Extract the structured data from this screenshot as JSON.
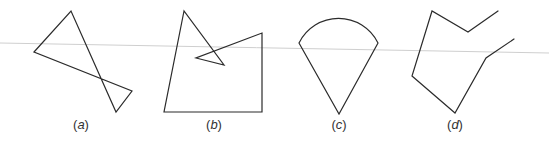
{
  "figure": {
    "stroke_color": "#2b2b2b",
    "background": "#ffffff",
    "panels": [
      {
        "id": "a",
        "label_open": "(",
        "label_letter": "a",
        "label_close": ")",
        "label_x": 81,
        "shape": "self-intersecting quadrilateral (bowtie)",
        "points": "34,52 71,11 116,112 132,91"
      },
      {
        "id": "b",
        "label_open": "(",
        "label_letter": "b",
        "label_close": ")",
        "label_x": 214,
        "shape": "self-intersecting polygon with inward spike",
        "points": "184,11 164,112 262,112 262,33 196,58 224,65"
      },
      {
        "id": "c",
        "label_open": "(",
        "label_letter": "c",
        "label_close": ")",
        "label_x": 339,
        "shape": "cone / ice-cream shape with circular arc top",
        "path": "M299,43 A44,44 0 0 1 378,43 L339,114 Z"
      },
      {
        "id": "d",
        "label_open": "(",
        "label_letter": "d",
        "label_close": ")",
        "label_x": 455,
        "shape": "open polyline (unclosed polygon)",
        "points": "498,11 468,32 432,11 412,76 455,113 486,58 514,39"
      }
    ],
    "scan_line": {
      "x1": 0,
      "y1": 43,
      "x2": 549,
      "y2": 53,
      "color": "#cfcfcf"
    }
  }
}
